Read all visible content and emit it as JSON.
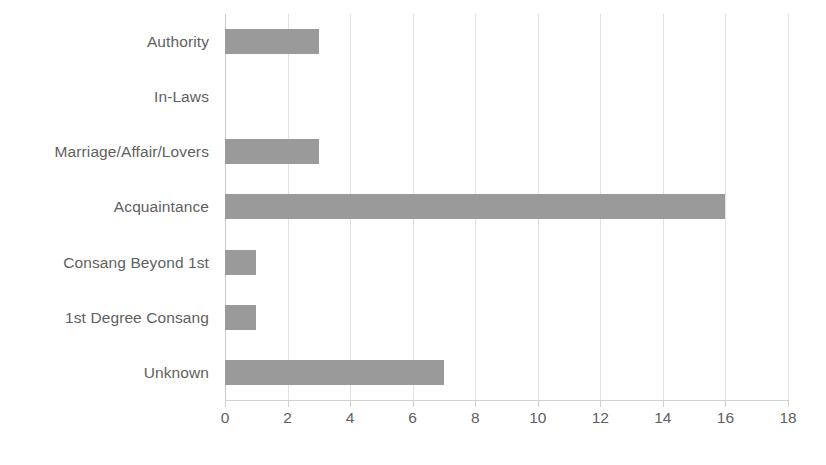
{
  "chart_data": {
    "type": "bar",
    "orientation": "horizontal",
    "title": "",
    "subtitle": "",
    "xlabel": "",
    "ylabel": "",
    "categories": [
      "Authority",
      "In-Laws",
      "Marriage/Affair/Lovers",
      "Acquaintance",
      "Consang Beyond 1st",
      "1st Degree Consang",
      "Unknown"
    ],
    "values": [
      3,
      0,
      3,
      16,
      1,
      1,
      7
    ],
    "xlim": [
      0,
      18
    ],
    "xticks": [
      0,
      2,
      4,
      6,
      8,
      10,
      12,
      14,
      16,
      18
    ],
    "xtick_labels": [
      "0",
      "2",
      "4",
      "6",
      "8",
      "10",
      "12",
      "14",
      "16",
      "18"
    ],
    "xtick_step": 2,
    "grid": true,
    "grid_axis": "x",
    "legend": false,
    "legend_position": "none",
    "bar_color": "#9a9a9a",
    "gridline_color": "#e2e2e2",
    "axis_color": "#c9c9c9",
    "text_color": "#5f5f5f",
    "background_color": "#ffffff"
  }
}
